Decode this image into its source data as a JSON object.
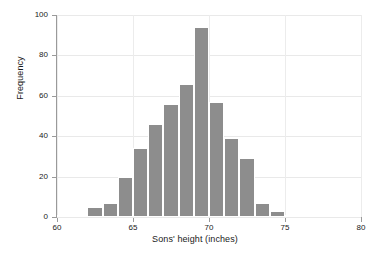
{
  "chart_data": {
    "type": "bar",
    "title": "",
    "xlabel": "Sons' height (inches)",
    "ylabel": "Frequency",
    "xlim": [
      60,
      80
    ],
    "ylim": [
      0,
      100
    ],
    "grid": true,
    "legend": null,
    "bin_width": 1,
    "bar_color": "#8d8d8d",
    "categories": [
      "60",
      "61",
      "62",
      "63",
      "64",
      "65",
      "66",
      "67",
      "68",
      "69",
      "70",
      "71",
      "72",
      "73",
      "74",
      "75",
      "76",
      "77",
      "78",
      "79"
    ],
    "bin_starts": [
      60,
      61,
      62,
      63,
      64,
      65,
      66,
      67,
      68,
      69,
      70,
      71,
      72,
      73,
      74,
      75,
      76,
      77,
      78,
      79
    ],
    "values": [
      1,
      0,
      5,
      7,
      20,
      34,
      46,
      56,
      66,
      94,
      57,
      39,
      29,
      7,
      3,
      1,
      0,
      0,
      1,
      0
    ],
    "xticks": [
      60,
      65,
      70,
      75,
      80
    ],
    "xtick_labels": [
      "60",
      "65",
      "70",
      "75",
      "80"
    ],
    "yticks": [
      0,
      20,
      40,
      60,
      80,
      100
    ],
    "ytick_labels": [
      "0",
      "20",
      "40",
      "60",
      "80",
      "100"
    ]
  }
}
